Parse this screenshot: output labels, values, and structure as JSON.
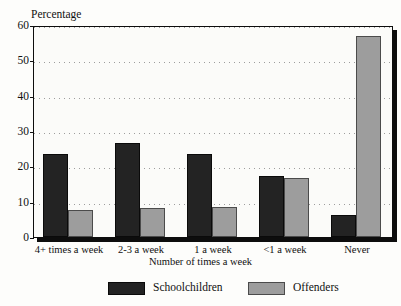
{
  "chart_data": {
    "type": "bar",
    "title": "",
    "cropped_title_fragment": "",
    "ylabel": "Percentage",
    "xlabel": "Number of times a week",
    "categories": [
      "4+ times a week",
      "2-3 a week",
      "1 a week",
      "<1 a week",
      "Never"
    ],
    "series": [
      {
        "name": "Schoolchildren",
        "color": "#232323",
        "values": [
          23.6,
          26.7,
          23.6,
          17.4,
          6.3
        ]
      },
      {
        "name": "Offenders",
        "color": "#9d9d9d",
        "values": [
          7.7,
          8.2,
          8.5,
          16.8,
          56.9
        ]
      }
    ],
    "ylim": [
      0,
      60
    ],
    "yticks": [
      0,
      10,
      20,
      30,
      40,
      50,
      60
    ],
    "ytick_labels": [
      "0",
      "10",
      "20",
      "30",
      "40",
      "50",
      "60"
    ],
    "grid": true,
    "grid_style": "dotted-horizontal",
    "legend_position": "bottom"
  },
  "legend": {
    "items": [
      {
        "label": "Schoolchildren",
        "color": "#232323"
      },
      {
        "label": "Offenders",
        "color": "#9d9d9d"
      }
    ]
  }
}
